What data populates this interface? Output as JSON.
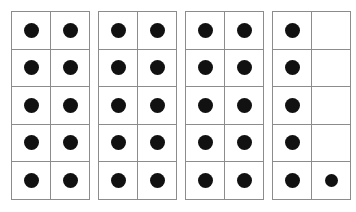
{
  "figure": {
    "total_counters": 36,
    "frame_count": 4,
    "rows_per_frame": 5,
    "columns_per_frame": 2,
    "cells_per_frame": 10,
    "colors": {
      "background": "#ffffff",
      "grid_line": "#8c8c8c",
      "counter": "#111111"
    },
    "frames": [
      {
        "index": 1,
        "name": "ten-frame-1",
        "filled_count": 10,
        "cells": [
          [
            true,
            true
          ],
          [
            true,
            true
          ],
          [
            true,
            true
          ],
          [
            true,
            true
          ],
          [
            true,
            true
          ]
        ]
      },
      {
        "index": 2,
        "name": "ten-frame-2",
        "filled_count": 10,
        "cells": [
          [
            true,
            true
          ],
          [
            true,
            true
          ],
          [
            true,
            true
          ],
          [
            true,
            true
          ],
          [
            true,
            true
          ]
        ]
      },
      {
        "index": 3,
        "name": "ten-frame-3",
        "filled_count": 10,
        "cells": [
          [
            true,
            true
          ],
          [
            true,
            true
          ],
          [
            true,
            true
          ],
          [
            true,
            true
          ],
          [
            true,
            true
          ]
        ]
      },
      {
        "index": 4,
        "name": "ten-frame-4",
        "filled_count": 6,
        "cells": [
          [
            true,
            false
          ],
          [
            true,
            false
          ],
          [
            true,
            false
          ],
          [
            true,
            false
          ],
          [
            true,
            true
          ]
        ]
      }
    ]
  }
}
